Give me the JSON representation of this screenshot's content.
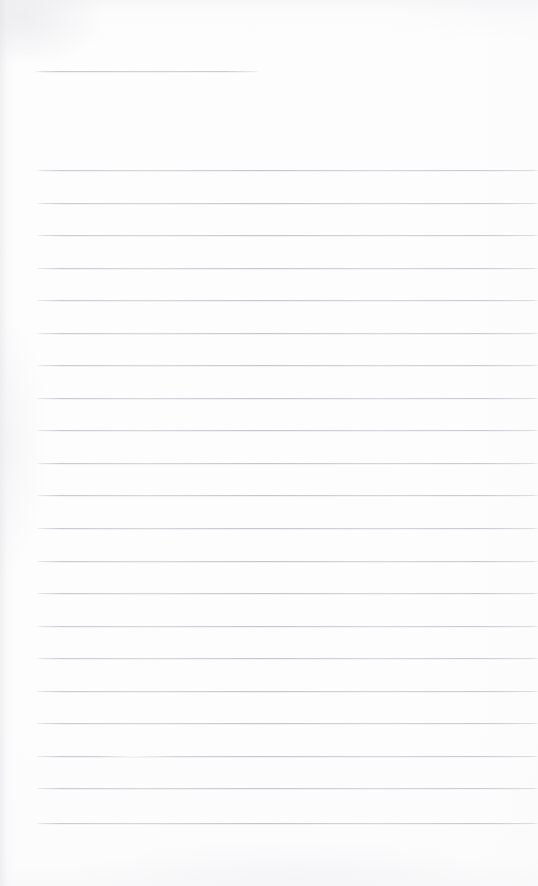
{
  "page": {
    "kind": "scanned-blank-lined-page",
    "width": 538,
    "height": 886,
    "background_color": "#fdfdfd",
    "has_text": false,
    "text_content": ""
  },
  "rules": {
    "color": "#c7c8ce",
    "thickness_px": 1,
    "header_rule": {
      "label": "header-rule",
      "y": 71,
      "x_start": 34,
      "x_end": 259
    },
    "body": {
      "count": 21,
      "x_start": 36,
      "x_end": 538,
      "first_y": 170,
      "spacing_px": 32.65,
      "y_positions": [
        170,
        203,
        235,
        268,
        300,
        333,
        365,
        398,
        430,
        463,
        495,
        528,
        561,
        593,
        626,
        658,
        691,
        723,
        756,
        788,
        823
      ],
      "faded_indices": [
        18
      ]
    }
  }
}
